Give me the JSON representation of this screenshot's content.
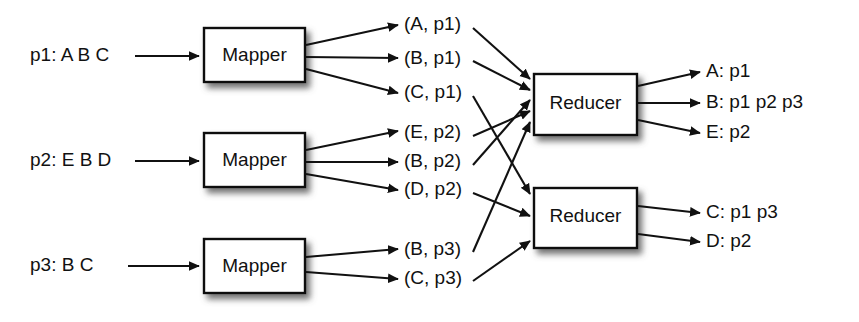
{
  "diagram": {
    "stroke_color": "#111111",
    "box_fill": "#ffffff",
    "shadow_color": "#8a8a8a",
    "inputs": [
      {
        "label": "p1: A B C"
      },
      {
        "label": "p2: E B D"
      },
      {
        "label": "p3: B C"
      }
    ],
    "mappers": [
      {
        "label": "Mapper"
      },
      {
        "label": "Mapper"
      },
      {
        "label": "Mapper"
      }
    ],
    "intermediate_pairs": [
      {
        "label": "(A, p1)"
      },
      {
        "label": "(B, p1)"
      },
      {
        "label": "(C, p1)"
      },
      {
        "label": "(E, p2)"
      },
      {
        "label": "(B, p2)"
      },
      {
        "label": "(D, p2)"
      },
      {
        "label": "(B, p3)"
      },
      {
        "label": "(C, p3)"
      }
    ],
    "reducers": [
      {
        "label": "Reducer"
      },
      {
        "label": "Reducer"
      }
    ],
    "outputs": [
      {
        "label": "A: p1"
      },
      {
        "label": "B: p1 p2 p3"
      },
      {
        "label": "E: p2"
      },
      {
        "label": "C: p1 p3"
      },
      {
        "label": "D: p2"
      }
    ]
  }
}
